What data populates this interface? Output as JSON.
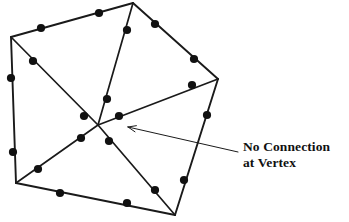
{
  "figure": {
    "name": "triangulated-polygon-mesh",
    "caption_visible": false,
    "background_color": "#ffffff",
    "line_color": "#1a1a1a",
    "node_color": "#111111",
    "annotation": {
      "line1": "No Connection",
      "line2": "at Vertex",
      "text_color": "#111111",
      "leader_start": [
        238,
        152
      ],
      "leader_end": [
        128,
        127
      ],
      "arrowhead_at": "end"
    },
    "geometry": {
      "outline_label": "polygon-outline",
      "polygon_vertices": [
        {
          "id": "v-top-left",
          "x": 11,
          "y": 37
        },
        {
          "id": "v-top",
          "x": 133,
          "y": 3
        },
        {
          "id": "v-right",
          "x": 218,
          "y": 79
        },
        {
          "id": "v-bottom-right",
          "x": 175,
          "y": 215
        },
        {
          "id": "v-bottom-left",
          "x": 16,
          "y": 183
        }
      ],
      "center_vertex": {
        "id": "v-center",
        "x": 98,
        "y": 125,
        "has_node": false
      },
      "outline_edges": [
        {
          "from": "v-top-left",
          "to": "v-top"
        },
        {
          "from": "v-top",
          "to": "v-right"
        },
        {
          "from": "v-right",
          "to": "v-bottom-right"
        },
        {
          "from": "v-bottom-right",
          "to": "v-bottom-left"
        },
        {
          "from": "v-bottom-left",
          "to": "v-top-left"
        }
      ],
      "interior_edges": [
        {
          "from": "v-top-left",
          "to": "v-center"
        },
        {
          "from": "v-top",
          "to": "v-center"
        },
        {
          "from": "v-right",
          "to": "v-center"
        },
        {
          "from": "v-bottom-right",
          "to": "v-center"
        },
        {
          "from": "v-bottom-left",
          "to": "v-center"
        }
      ],
      "edge_midpoint_nodes": [
        {
          "id": "n-top-1",
          "x": 41,
          "y": 28
        },
        {
          "id": "n-top-2",
          "x": 99,
          "y": 13
        },
        {
          "id": "n-topright-1",
          "x": 155,
          "y": 24
        },
        {
          "id": "n-topright-2",
          "x": 194,
          "y": 59
        },
        {
          "id": "n-right-1",
          "x": 207,
          "y": 115
        },
        {
          "id": "n-right-2",
          "x": 184,
          "y": 180
        },
        {
          "id": "n-bottom-1",
          "x": 127,
          "y": 203
        },
        {
          "id": "n-bottom-2",
          "x": 60,
          "y": 193
        },
        {
          "id": "n-left-1",
          "x": 11,
          "y": 78
        },
        {
          "id": "n-left-2",
          "x": 13,
          "y": 152
        },
        {
          "id": "n-diag-tl-1",
          "x": 33,
          "y": 61
        },
        {
          "id": "n-diag-tl-2",
          "x": 84,
          "y": 116
        },
        {
          "id": "n-diag-top-1",
          "x": 127,
          "y": 30
        },
        {
          "id": "n-diag-top-2",
          "x": 107,
          "y": 99
        },
        {
          "id": "n-diag-right-1",
          "x": 192,
          "y": 85
        },
        {
          "id": "n-diag-right-2",
          "x": 119,
          "y": 116
        },
        {
          "id": "n-diag-br-1",
          "x": 155,
          "y": 190
        },
        {
          "id": "n-diag-br-2",
          "x": 109,
          "y": 141
        },
        {
          "id": "n-diag-bl-1",
          "x": 38,
          "y": 169
        },
        {
          "id": "n-diag-bl-2",
          "x": 81,
          "y": 138
        }
      ],
      "node_radius": 4.1,
      "outline_stroke_width": 1.9,
      "interior_stroke_width": 1.7,
      "leader_stroke_width": 1.0
    }
  }
}
